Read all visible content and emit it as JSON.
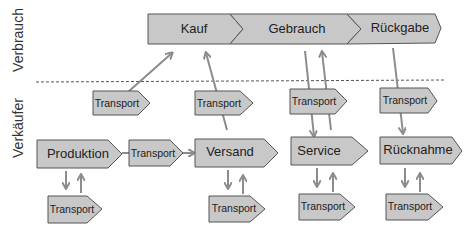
{
  "lanes": {
    "top": "Verbrauch",
    "bottom": "Verkäufer"
  },
  "consumer_chain": [
    {
      "label": "Kauf"
    },
    {
      "label": "Gebrauch"
    },
    {
      "label": "Rückgabe"
    }
  ],
  "seller_stages": [
    {
      "label": "Produktion"
    },
    {
      "label": "Versand"
    },
    {
      "label": "Service"
    },
    {
      "label": "Rücknahme"
    }
  ],
  "transport_label": "Transport",
  "transports": [
    {
      "label": "Transport",
      "position": "upper-produktion"
    },
    {
      "label": "Transport",
      "position": "upper-versand"
    },
    {
      "label": "Transport",
      "position": "upper-service"
    },
    {
      "label": "Transport",
      "position": "upper-ruecknahme"
    },
    {
      "label": "Transport",
      "position": "between-produktion-versand"
    },
    {
      "label": "Transport",
      "position": "lower-produktion"
    },
    {
      "label": "Transport",
      "position": "lower-versand"
    },
    {
      "label": "Transport",
      "position": "lower-service"
    },
    {
      "label": "Transport",
      "position": "lower-ruecknahme"
    }
  ],
  "colors": {
    "box_fill": "#c8c8c8",
    "box_stroke": "#555555",
    "arrow": "#8c8c8c",
    "divider": "#555555"
  }
}
